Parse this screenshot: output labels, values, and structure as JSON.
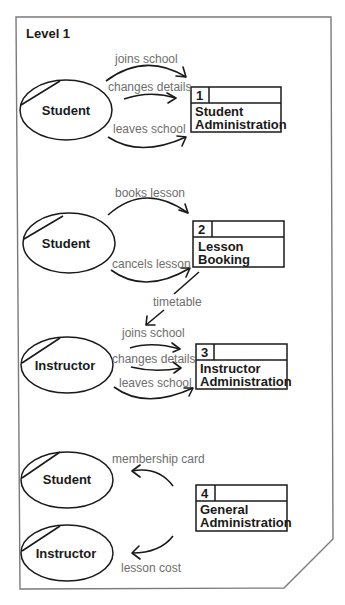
{
  "diagram": {
    "title": "Level 1",
    "entities": [
      {
        "id": "e1",
        "label": "Student"
      },
      {
        "id": "e2",
        "label": "Student"
      },
      {
        "id": "e3",
        "label": "Instructor"
      },
      {
        "id": "e4",
        "label": "Student"
      },
      {
        "id": "e5",
        "label": "Instructor"
      }
    ],
    "processes": [
      {
        "number": "1",
        "line1": "Student",
        "line2": "Administration"
      },
      {
        "number": "2",
        "line1": "Lesson",
        "line2": "Booking"
      },
      {
        "number": "3",
        "line1": "Instructor",
        "line2": "Administration"
      },
      {
        "number": "4",
        "line1": "General",
        "line2": "Administration"
      }
    ],
    "flows": [
      {
        "label": "joins school",
        "from": "Student",
        "to": "1"
      },
      {
        "label": "changes details",
        "from": "Student",
        "to": "1"
      },
      {
        "label": "leaves school",
        "from": "Student",
        "to": "1"
      },
      {
        "label": "books lesson",
        "from": "Student",
        "to": "2"
      },
      {
        "label": "cancels lesson",
        "from": "Student",
        "to": "2"
      },
      {
        "label": "timetable",
        "from": "2",
        "to": "Instructor"
      },
      {
        "label": "joins school",
        "from": "Instructor",
        "to": "3"
      },
      {
        "label": "changes details",
        "from": "Instructor",
        "to": "3"
      },
      {
        "label": "leaves school",
        "from": "Instructor",
        "to": "3"
      },
      {
        "label": "membership card",
        "from": "4",
        "to": "Student"
      },
      {
        "label": "lesson cost",
        "from": "4",
        "to": "Instructor"
      }
    ]
  }
}
